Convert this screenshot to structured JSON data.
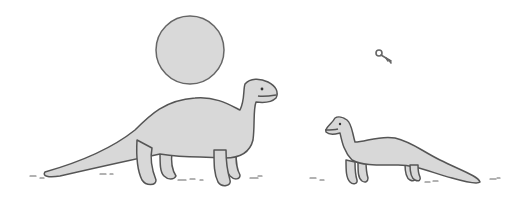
{
  "scene": {
    "description": "Cartoon illustration of two dinosaurs, a large one and a small one, facing each other under a round moon/sun; a small key floats in the sky",
    "colors": {
      "background": "#ffffff",
      "fill": "#d8d8d8",
      "moon_fill": "#d9d9d9",
      "outline": "#555555",
      "ground_marks": "#666666"
    }
  }
}
